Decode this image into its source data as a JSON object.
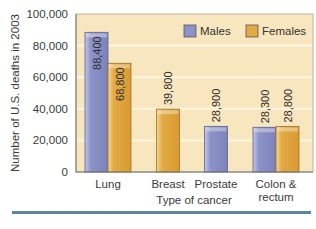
{
  "chart_data": {
    "type": "bar",
    "title": "",
    "xlabel": "Type of cancer",
    "ylabel": "Number of U.S. deaths in 2003",
    "ylim": [
      0,
      100000
    ],
    "yticks": [
      0,
      20000,
      40000,
      60000,
      80000,
      100000
    ],
    "ytick_labels": [
      "0",
      "20,000",
      "40,000",
      "60,000",
      "80,000",
      "100,000"
    ],
    "categories": [
      "Lung",
      "Breast",
      "Prostate",
      "Colon & rectum"
    ],
    "category_lines": [
      [
        "Lung"
      ],
      [
        "Breast"
      ],
      [
        "Prostate"
      ],
      [
        "Colon &",
        "rectum"
      ]
    ],
    "series": [
      {
        "name": "Males",
        "color": "#8d93c8",
        "values": [
          88400,
          null,
          28900,
          28300
        ],
        "labels": [
          "88,400",
          null,
          "28,900",
          "28,300"
        ]
      },
      {
        "name": "Females",
        "color": "#e2aa45",
        "values": [
          68800,
          39800,
          null,
          28800
        ],
        "labels": [
          "68,800",
          "39,800",
          null,
          "28,800"
        ]
      }
    ],
    "legend_position": "top-right",
    "grid": true,
    "plot_background": "#f8e6bf",
    "gridline_color": "#fdf5e4",
    "bottom_rule_color": "#5a86a6"
  }
}
